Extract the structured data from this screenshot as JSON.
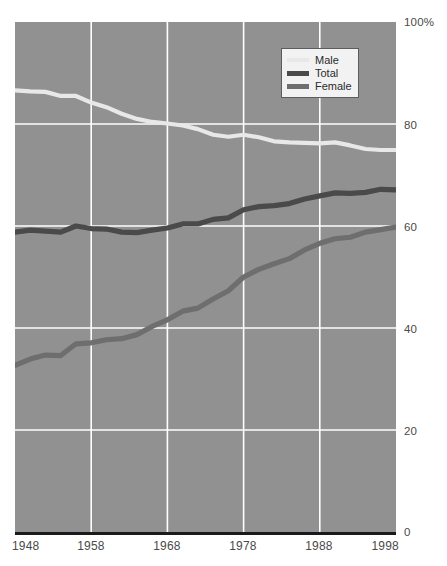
{
  "chart_data": {
    "type": "line",
    "title": "",
    "xlabel": "",
    "ylabel": "",
    "xlim": [
      1948,
      1998
    ],
    "ylim": [
      0,
      100
    ],
    "grid": true,
    "legend_position": "top-right",
    "background_color": "#919191",
    "gridline_color": "#ffffff",
    "axis_line_color": "#1a1a1a",
    "x_ticks": [
      "1948",
      "1958",
      "1968",
      "1978",
      "1988",
      "1998"
    ],
    "x_tick_values": [
      1948,
      1958,
      1968,
      1978,
      1988,
      1998
    ],
    "y_ticks": [
      "100%",
      "80",
      "60",
      "40",
      "20",
      "0"
    ],
    "y_tick_values": [
      100,
      80,
      60,
      40,
      20,
      0
    ],
    "x": [
      1948,
      1950,
      1952,
      1954,
      1956,
      1958,
      1960,
      1962,
      1964,
      1966,
      1968,
      1970,
      1972,
      1974,
      1976,
      1978,
      1980,
      1982,
      1984,
      1986,
      1988,
      1990,
      1992,
      1994,
      1996,
      1998
    ],
    "series": [
      {
        "name": "Male",
        "color": "#e8e8e8",
        "values": [
          86.6,
          86.4,
          86.3,
          85.5,
          85.5,
          84.2,
          83.3,
          82.0,
          81.0,
          80.4,
          80.1,
          79.7,
          79.0,
          77.9,
          77.5,
          77.9,
          77.4,
          76.6,
          76.4,
          76.3,
          76.2,
          76.4,
          75.8,
          75.1,
          74.9,
          74.9
        ]
      },
      {
        "name": "Total",
        "color": "#4a4a4a",
        "values": [
          58.8,
          59.2,
          59.0,
          58.8,
          60.0,
          59.5,
          59.4,
          58.8,
          58.7,
          59.2,
          59.6,
          60.4,
          60.4,
          61.3,
          61.6,
          63.2,
          63.8,
          64.0,
          64.4,
          65.3,
          65.9,
          66.5,
          66.4,
          66.6,
          67.2,
          67.1
        ]
      },
      {
        "name": "Female",
        "color": "#6e6e6e",
        "values": [
          32.7,
          33.9,
          34.7,
          34.6,
          36.9,
          37.1,
          37.7,
          37.9,
          38.7,
          40.3,
          41.6,
          43.3,
          43.9,
          45.7,
          47.3,
          50.0,
          51.5,
          52.6,
          53.6,
          55.3,
          56.6,
          57.5,
          57.8,
          58.8,
          59.3,
          59.8
        ]
      }
    ],
    "legend_entries": [
      {
        "label": "Male",
        "color": "#e8e8e8",
        "swatch_weight": "thin"
      },
      {
        "label": "Total",
        "color": "#4a4a4a",
        "swatch_weight": "thick"
      },
      {
        "label": "Female",
        "color": "#6e6e6e",
        "swatch_weight": "thick"
      }
    ]
  }
}
